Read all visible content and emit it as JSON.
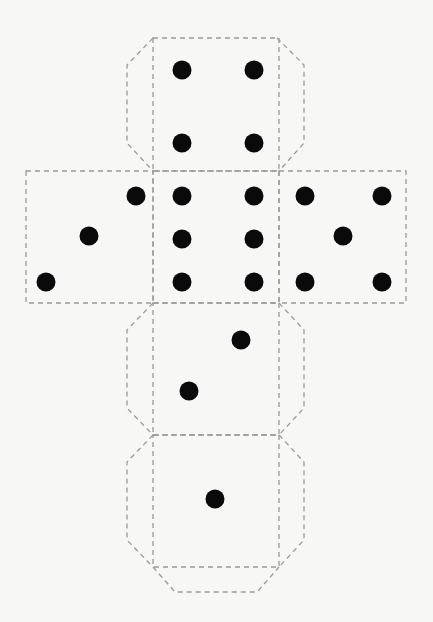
{
  "colors": {
    "background": "#f7f7f6",
    "cut_line": "#9a9a9a",
    "pip": "#0a0a0a"
  },
  "diagram": {
    "type": "cube-net",
    "line_style": "dashed",
    "pip_radius": 9.5,
    "faces": [
      {
        "id": "top",
        "value": 4,
        "rect": [
          153,
          38,
          279,
          171
        ],
        "pips": [
          [
            182,
            70
          ],
          [
            254,
            70
          ],
          [
            182,
            143
          ],
          [
            254,
            143
          ]
        ]
      },
      {
        "id": "left",
        "value": 3,
        "rect": [
          26,
          171,
          153,
          303
        ],
        "pips": [
          [
            136,
            196
          ],
          [
            89,
            236
          ],
          [
            46,
            282
          ]
        ]
      },
      {
        "id": "center",
        "value": 6,
        "rect": [
          153,
          171,
          279,
          303
        ],
        "pips": [
          [
            182,
            196
          ],
          [
            254,
            196
          ],
          [
            182,
            239
          ],
          [
            254,
            239
          ],
          [
            182,
            282
          ],
          [
            254,
            282
          ]
        ]
      },
      {
        "id": "right",
        "value": 5,
        "rect": [
          279,
          171,
          406,
          303
        ],
        "pips": [
          [
            305,
            196
          ],
          [
            382,
            196
          ],
          [
            343,
            236
          ],
          [
            305,
            282
          ],
          [
            382,
            282
          ]
        ]
      },
      {
        "id": "lower",
        "value": 2,
        "rect": [
          153,
          303,
          279,
          435
        ],
        "pips": [
          [
            241,
            340
          ],
          [
            189,
            391
          ]
        ]
      },
      {
        "id": "bottom",
        "value": 1,
        "rect": [
          153,
          435,
          279,
          567
        ],
        "pips": [
          [
            215,
            499
          ]
        ]
      }
    ],
    "flaps": [
      {
        "id": "top-left-flap",
        "points": "153,38 127,65 127,143 153,171"
      },
      {
        "id": "top-right-flap",
        "points": "277,38 304,65 304,143 279,171"
      },
      {
        "id": "lower-left-flap",
        "points": "153,303 127,330 127,408 153,435"
      },
      {
        "id": "lower-right-flap",
        "points": "279,303 304,330 304,408 279,435"
      },
      {
        "id": "bottom-left-flap",
        "points": "153,435 127,462 127,540 153,567"
      },
      {
        "id": "bottom-right-flap",
        "points": "279,435 304,462 304,540 279,567"
      },
      {
        "id": "bottom-end-flap",
        "points": "153,567 175,592 257,592 279,567"
      }
    ]
  }
}
